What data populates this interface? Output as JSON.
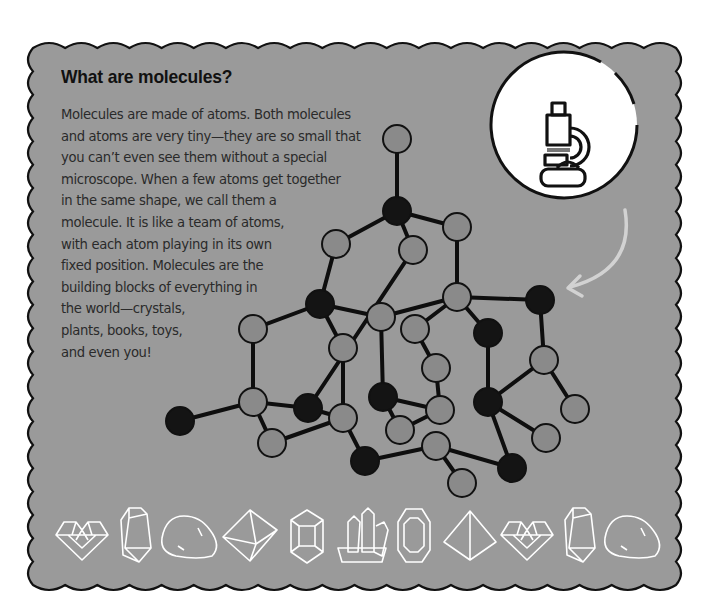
{
  "title": "What are molecules?",
  "body_lines": [
    "Molecules are made of atoms. Both molecules",
    "and atoms are very tiny—they are so small that",
    "you can’t even see them without a special",
    "microscope. When a few atoms get together",
    "in the same shape, we call them a",
    "molecule. It is like a team of atoms,",
    "with each atom playing in its own",
    "fixed position. Molecules are the",
    "building blocks of everything in",
    "the world—crystals,",
    "plants, books, toys,",
    "and even you!"
  ],
  "colors": {
    "panel_bg": "#9a9a9a",
    "panel_border": "#111111",
    "atom_gray": "#8a8a8a",
    "atom_black": "#141414",
    "bond": "#0e0e0e",
    "icon_circle_bg": "#ffffff",
    "arrow": "#d0d0d0",
    "gem_outline": "#ffffff"
  },
  "icons": {
    "microscope": "microscope-icon",
    "arrow": "curved-arrow-icon"
  },
  "gems": [
    "heart-gem-icon",
    "tall-crystal-icon",
    "pebble-icon",
    "octahedron-gem-icon",
    "hexagonal-prism-icon",
    "crystal-cluster-icon",
    "hexagon-gem-icon",
    "pyramid-gem-icon",
    "heart-gem-icon",
    "tall-crystal-icon",
    "pebble-icon"
  ]
}
